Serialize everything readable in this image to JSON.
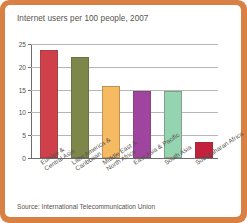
{
  "figure": {
    "frame_color": "#d98144",
    "card_color": "#ffffff",
    "source_note": "Source: International Telecommunication Union"
  },
  "chart_data": {
    "type": "bar",
    "title": "Internet users per 100 people, 2007",
    "xlabel": "",
    "ylabel": "",
    "ylim": [
      0,
      25
    ],
    "yticks": [
      0,
      5,
      10,
      15,
      20,
      25
    ],
    "ytick_labels": [
      "0",
      "5",
      "10",
      "15",
      "20",
      "25"
    ],
    "grid": true,
    "legend": "none",
    "categories": [
      "Europe & Central Asia",
      "Latin America & Caribbean",
      "Middle East & North Africa",
      "East Asia & Pacific",
      "South Asia",
      "Sub-Saharan Africa"
    ],
    "category_lines": [
      [
        "Europe &",
        "Central Asia"
      ],
      [
        "Latin America &",
        "Caribbean"
      ],
      [
        "Middle East &",
        "North Africa"
      ],
      [
        "East Asia & Pacific"
      ],
      [
        "South Asia"
      ],
      [
        "Sub-Saharan Africa"
      ]
    ],
    "values": [
      23.7,
      22.2,
      15.7,
      14.8,
      14.6,
      3.5
    ],
    "bar_colors": [
      "#cf404a",
      "#7d8749",
      "#f6bb62",
      "#a0459f",
      "#94d4b1",
      "#c4213c"
    ]
  }
}
